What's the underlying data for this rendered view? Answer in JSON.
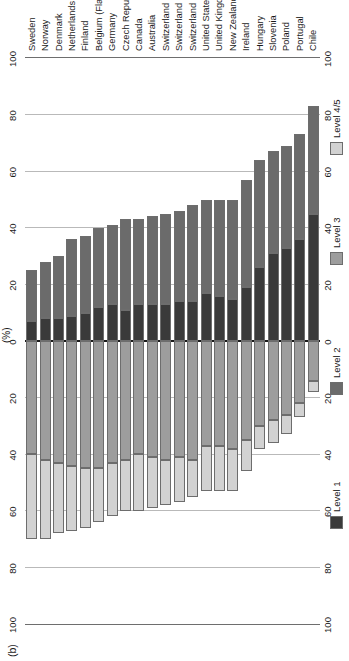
{
  "figure": {
    "panel_label": "(b)",
    "axis_title": "(%)"
  },
  "chart_data": {
    "type": "bar",
    "subtype": "diverging-stacked-horizontal",
    "title": "",
    "panel_label": "(b)",
    "xlabel": "(%)",
    "ylabel": "",
    "orientation": "rotated-90",
    "grid": true,
    "xlim": [
      -100,
      100
    ],
    "xticks": [
      -100,
      -80,
      -60,
      -40,
      -20,
      0,
      20,
      40,
      60,
      80,
      100
    ],
    "xticklabels": [
      "100",
      "80",
      "60",
      "40",
      "20",
      "0",
      "20",
      "40",
      "60",
      "80",
      "100"
    ],
    "diverging_origin": 0,
    "negative_direction_note": "Levels 3 and 4/5 are plotted to the left of zero; Levels 1 and 2 to the right.",
    "legend": {
      "position": "bottom",
      "entries": [
        {
          "label": "Level 1",
          "color": "#3a3a3a"
        },
        {
          "label": "Level 2",
          "color": "#6b6b6b"
        },
        {
          "label": "Level 3",
          "color": "#9d9d9d"
        },
        {
          "label": "Level 4/5",
          "color": "#d2d2d2"
        }
      ]
    },
    "series": [
      {
        "name": "Level 1",
        "color": "#3a3a3a",
        "side": "right"
      },
      {
        "name": "Level 2",
        "color": "#6b6b6b",
        "side": "right"
      },
      {
        "name": "Level 3",
        "color": "#9d9d9d",
        "side": "left"
      },
      {
        "name": "Level 4/5",
        "color": "#d2d2d2",
        "side": "left"
      }
    ],
    "categories": [
      "Sweden",
      "Norway",
      "Denmark",
      "Netherlands",
      "Finland",
      "Belgium (Flanders)",
      "Germany",
      "Czech Republic",
      "Canada",
      "Australia",
      "Switzerland (French)",
      "Switzerland (German)",
      "Switzerland (Italian)",
      "United States",
      "United Kingdom",
      "New Zealand",
      "Ireland",
      "Hungary",
      "Slovenia",
      "Poland",
      "Portugal",
      "Chile"
    ],
    "rows": [
      {
        "category": "Sweden",
        "level_1": 7,
        "level_2": 18,
        "level_3": 40,
        "level_4_5": 30
      },
      {
        "category": "Norway",
        "level_1": 8,
        "level_2": 20,
        "level_3": 42,
        "level_4_5": 28
      },
      {
        "category": "Denmark",
        "level_1": 8,
        "level_2": 22,
        "level_3": 43,
        "level_4_5": 25
      },
      {
        "category": "Netherlands",
        "level_1": 9,
        "level_2": 27,
        "level_3": 44,
        "level_4_5": 23
      },
      {
        "category": "Finland",
        "level_1": 10,
        "level_2": 27,
        "level_3": 45,
        "level_4_5": 21
      },
      {
        "category": "Belgium (Flanders)",
        "level_1": 12,
        "level_2": 28,
        "level_3": 45,
        "level_4_5": 19
      },
      {
        "category": "Germany",
        "level_1": 13,
        "level_2": 28,
        "level_3": 43,
        "level_4_5": 19
      },
      {
        "category": "Czech Republic",
        "level_1": 11,
        "level_2": 32,
        "level_3": 42,
        "level_4_5": 18
      },
      {
        "category": "Canada",
        "level_1": 13,
        "level_2": 30,
        "level_3": 40,
        "level_4_5": 20
      },
      {
        "category": "Australia",
        "level_1": 13,
        "level_2": 31,
        "level_3": 41,
        "level_4_5": 18
      },
      {
        "category": "Switzerland (French)",
        "level_1": 13,
        "level_2": 32,
        "level_3": 42,
        "level_4_5": 16
      },
      {
        "category": "Switzerland (German)",
        "level_1": 14,
        "level_2": 32,
        "level_3": 41,
        "level_4_5": 16
      },
      {
        "category": "Switzerland (Italian)",
        "level_1": 14,
        "level_2": 34,
        "level_3": 42,
        "level_4_5": 13
      },
      {
        "category": "United States",
        "level_1": 17,
        "level_2": 33,
        "level_3": 37,
        "level_4_5": 16
      },
      {
        "category": "United Kingdom",
        "level_1": 16,
        "level_2": 34,
        "level_3": 37,
        "level_4_5": 16
      },
      {
        "category": "New Zealand",
        "level_1": 15,
        "level_2": 35,
        "level_3": 38,
        "level_4_5": 15
      },
      {
        "category": "Ireland",
        "level_1": 19,
        "level_2": 38,
        "level_3": 35,
        "level_4_5": 11
      },
      {
        "category": "Hungary",
        "level_1": 26,
        "level_2": 38,
        "level_3": 30,
        "level_4_5": 8
      },
      {
        "category": "Slovenia",
        "level_1": 31,
        "level_2": 36,
        "level_3": 28,
        "level_4_5": 8
      },
      {
        "category": "Poland",
        "level_1": 33,
        "level_2": 36,
        "level_3": 26,
        "level_4_5": 7
      },
      {
        "category": "Portugal",
        "level_1": 36,
        "level_2": 37,
        "level_3": 22,
        "level_4_5": 5
      },
      {
        "category": "Chile",
        "level_1": 45,
        "level_2": 38,
        "level_3": 14,
        "level_4_5": 4
      }
    ]
  }
}
